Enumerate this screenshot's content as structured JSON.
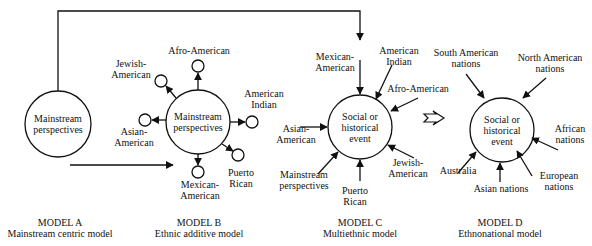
{
  "models": [
    {
      "id": "A",
      "title": "MODEL A",
      "subtitle": "Mainstream centric model",
      "center_line1": "Mainstream",
      "center_line2": "perspectives"
    },
    {
      "id": "B",
      "title": "MODEL B",
      "subtitle": "Ethnic additive model",
      "center_line1": "Mainstream",
      "center_line2": "perspectives",
      "satellites": [
        {
          "line1": "Afro-American",
          "line2": ""
        },
        {
          "line1": "Jewish-",
          "line2": "American"
        },
        {
          "line1": "American",
          "line2": "Indian"
        },
        {
          "line1": "Asian-",
          "line2": "American"
        },
        {
          "line1": "Puerto",
          "line2": "Rican"
        },
        {
          "line1": "Mexican-",
          "line2": "American"
        }
      ]
    },
    {
      "id": "C",
      "title": "MODEL C",
      "subtitle": "Multiethnic model",
      "center_line1": "Social or",
      "center_line2": "historical",
      "center_line3": "event",
      "inputs": [
        {
          "line1": "Mexican-",
          "line2": "American"
        },
        {
          "line1": "American",
          "line2": "Indian"
        },
        {
          "line1": "Afro-American",
          "line2": ""
        },
        {
          "line1": "Asian-",
          "line2": "American"
        },
        {
          "line1": "Mainstream",
          "line2": "perspectives"
        },
        {
          "line1": "Puerto",
          "line2": "Rican"
        },
        {
          "line1": "Jewish-",
          "line2": "American"
        }
      ]
    },
    {
      "id": "D",
      "title": "MODEL D",
      "subtitle": "Ethnonational model",
      "center_line1": "Social or",
      "center_line2": "historical",
      "center_line3": "event",
      "inputs": [
        {
          "line1": "South American",
          "line2": "nations"
        },
        {
          "line1": "North American",
          "line2": "nations"
        },
        {
          "line1": "African",
          "line2": "nations"
        },
        {
          "line1": "Australia",
          "line2": ""
        },
        {
          "line1": "Asian nations",
          "line2": ""
        },
        {
          "line1": "European",
          "line2": "nations"
        }
      ]
    }
  ],
  "colors": {
    "stroke": "#111111",
    "background": "#ffffff"
  }
}
